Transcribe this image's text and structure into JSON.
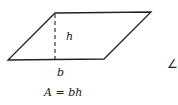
{
  "diagram": {
    "shape": "parallelogram",
    "vertices": {
      "top_left": [
        55,
        13
      ],
      "top_right": [
        151,
        12
      ],
      "bottom_right": [
        104,
        59
      ],
      "bottom_left": [
        8,
        60
      ]
    },
    "height_line": {
      "x": 55,
      "y1": 13,
      "y2": 60,
      "style": "dashed"
    },
    "labels": {
      "height": "h",
      "base": "b"
    },
    "formula": {
      "lhs": "A",
      "eq": " = ",
      "rhs": "bh"
    },
    "partial_symbol": "∠",
    "colors": {
      "stroke": "#222222",
      "background": "#ffffff"
    }
  }
}
